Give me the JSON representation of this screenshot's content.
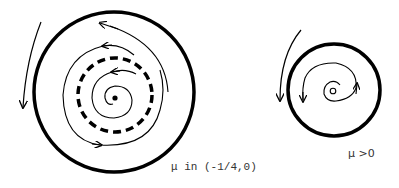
{
  "diagram": {
    "left_panel": {
      "caption": "μ in (-1/4,0)",
      "elements": [
        "stable-limit-cycle",
        "unstable-limit-cycle-dashed",
        "stable-focus",
        "trajectories"
      ]
    },
    "right_panel": {
      "caption": "μ >0",
      "elements": [
        "stable-limit-cycle",
        "unstable-focus",
        "trajectories"
      ]
    },
    "colors": {
      "stroke": "#000000",
      "background": "#ffffff",
      "text": "#333333"
    }
  }
}
